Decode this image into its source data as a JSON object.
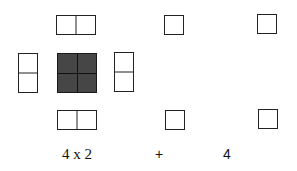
{
  "diagram": {
    "center_square": {
      "fill": "#3a3a3a",
      "grid": "2x2"
    },
    "dominoes": [
      {
        "position": "top",
        "orientation": "horizontal"
      },
      {
        "position": "left",
        "orientation": "vertical"
      },
      {
        "position": "right",
        "orientation": "vertical"
      },
      {
        "position": "bottom",
        "orientation": "horizontal"
      }
    ],
    "unit_squares": [
      {
        "position": "top-middle"
      },
      {
        "position": "top-right"
      },
      {
        "position": "bottom-middle"
      },
      {
        "position": "bottom-right"
      }
    ],
    "labels": {
      "dominoes_count": "4 x 2",
      "plus": "+",
      "squares_count": "4"
    }
  }
}
